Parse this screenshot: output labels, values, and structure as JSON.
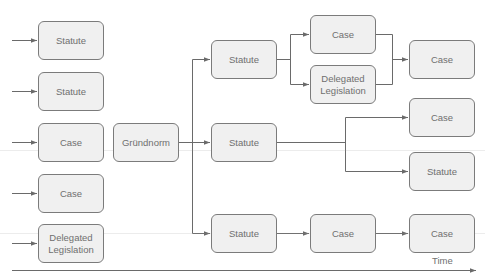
{
  "diagram": {
    "type": "flow",
    "colors": {
      "node_fill": "#f0f0f0",
      "node_border": "#7b7b7b",
      "text": "#6f6f6f",
      "line": "#6a6a6a"
    },
    "nodes": [
      {
        "id": "in1",
        "label": "Statute",
        "x": 38,
        "y": 21
      },
      {
        "id": "in2",
        "label": "Statute",
        "x": 38,
        "y": 72
      },
      {
        "id": "in3",
        "label": "Case",
        "x": 38,
        "y": 123
      },
      {
        "id": "in4",
        "label": "Case",
        "x": 38,
        "y": 174
      },
      {
        "id": "in5",
        "label": "Delegated\nLegislation",
        "x": 38,
        "y": 224
      },
      {
        "id": "grundnorm",
        "label": "Gründnorm",
        "x": 113,
        "y": 123
      },
      {
        "id": "statute_top",
        "label": "Statute",
        "x": 211,
        "y": 40
      },
      {
        "id": "statute_mid",
        "label": "Statute",
        "x": 211,
        "y": 123
      },
      {
        "id": "statute_bot",
        "label": "Statute",
        "x": 211,
        "y": 214
      },
      {
        "id": "case_top",
        "label": "Case",
        "x": 310,
        "y": 15
      },
      {
        "id": "delegated_mid",
        "label": "Delegated\nLegislation",
        "x": 310,
        "y": 65
      },
      {
        "id": "case_bot_mid",
        "label": "Case",
        "x": 310,
        "y": 214
      },
      {
        "id": "case_right_top",
        "label": "Case",
        "x": 409,
        "y": 40
      },
      {
        "id": "case_right_mid",
        "label": "Case",
        "x": 409,
        "y": 98
      },
      {
        "id": "statute_right",
        "label": "Statute",
        "x": 409,
        "y": 152
      },
      {
        "id": "case_right_bot",
        "label": "Case",
        "x": 409,
        "y": 214
      }
    ],
    "edges": [
      {
        "from": "external",
        "to": "in1"
      },
      {
        "from": "external",
        "to": "in2"
      },
      {
        "from": "external",
        "to": "in3"
      },
      {
        "from": "external",
        "to": "in4"
      },
      {
        "from": "external",
        "to": "in5"
      },
      {
        "from": "grundnorm",
        "to": "statute_top"
      },
      {
        "from": "grundnorm",
        "to": "statute_mid"
      },
      {
        "from": "grundnorm",
        "to": "statute_bot"
      },
      {
        "from": "statute_top",
        "to": "case_top"
      },
      {
        "from": "statute_top",
        "to": "delegated_mid"
      },
      {
        "from": "case_top",
        "to": "case_right_top"
      },
      {
        "from": "delegated_mid",
        "to": "case_right_top"
      },
      {
        "from": "statute_mid",
        "to": "case_right_mid"
      },
      {
        "from": "statute_mid",
        "to": "statute_right"
      },
      {
        "from": "statute_bot",
        "to": "case_bot_mid"
      },
      {
        "from": "case_bot_mid",
        "to": "case_right_bot"
      }
    ],
    "time_axis": {
      "label": "Time"
    }
  }
}
